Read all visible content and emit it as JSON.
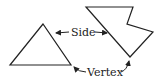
{
  "diagram": {
    "labels": {
      "side": "Side",
      "vertex": "Vertex"
    },
    "shapes": [
      {
        "name": "triangle",
        "points": [
          [
            43,
            24
          ],
          [
            10,
            65
          ],
          [
            71,
            65
          ]
        ]
      },
      {
        "name": "irregular-pentagon",
        "points": [
          [
            86,
            7
          ],
          [
            133,
            7
          ],
          [
            127,
            24
          ],
          [
            153,
            32
          ],
          [
            130,
            57
          ]
        ]
      }
    ],
    "colors": {
      "stroke": "#222222",
      "background": "#ffffff"
    }
  }
}
